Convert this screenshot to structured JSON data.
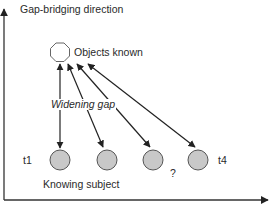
{
  "diagram": {
    "y_axis_label": "Gap-bridging direction",
    "object_label": "Objects known",
    "gap_label": "Widening gap",
    "subject_label": "Knowing subject",
    "time_labels": {
      "start": "t1",
      "end": "t4"
    },
    "unknown_marker": "?",
    "colors": {
      "line": "#222222",
      "circle_fill": "#c8c8c8",
      "circle_stroke": "#555555",
      "octagon_stroke": "#666666"
    },
    "nodes": {
      "object": {
        "shape": "octagon",
        "cx": 60,
        "cy": 52
      },
      "subjects": [
        {
          "cx": 60,
          "cy": 160
        },
        {
          "cx": 107,
          "cy": 160
        },
        {
          "cx": 153,
          "cy": 160
        },
        {
          "cx": 198,
          "cy": 160
        }
      ]
    },
    "edges": [
      {
        "from": "object",
        "to": "subject-1",
        "type": "double-arrow"
      },
      {
        "from": "object",
        "to": "subject-2",
        "type": "double-arrow"
      },
      {
        "from": "object",
        "to": "subject-3",
        "type": "double-arrow"
      },
      {
        "from": "object",
        "to": "subject-4",
        "type": "double-arrow"
      }
    ]
  }
}
